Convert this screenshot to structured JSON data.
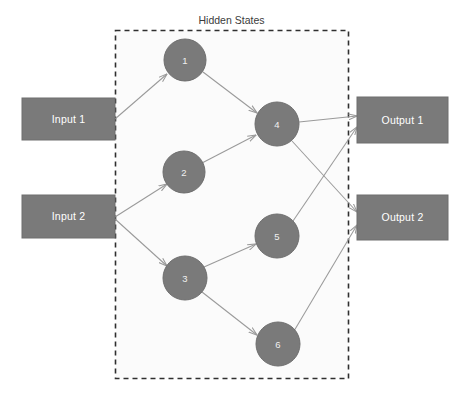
{
  "diagram": {
    "title": "Hidden States",
    "colors": {
      "node_fill": "#7a7a7a",
      "node_stroke": "#6e6e6e",
      "edge": "#9a9a9a",
      "group_border": "#2f2f2f",
      "group_fill": "#fbfbfb",
      "label_text": "#ffffff",
      "title_text": "#3b3b3b",
      "background": "#ffffff"
    },
    "group": {
      "label": "Hidden States",
      "x": 115,
      "y": 30,
      "width": 233,
      "height": 348
    },
    "inputs": [
      {
        "id": "input-1",
        "label": "Input 1",
        "x": 22,
        "y": 98,
        "width": 93,
        "height": 42
      },
      {
        "id": "input-2",
        "label": "Input 2",
        "x": 22,
        "y": 195,
        "width": 93,
        "height": 43
      }
    ],
    "outputs": [
      {
        "id": "output-1",
        "label": "Output 1",
        "x": 357,
        "y": 97,
        "width": 91,
        "height": 46
      },
      {
        "id": "output-2",
        "label": "Output 2",
        "x": 357,
        "y": 195,
        "width": 91,
        "height": 45
      }
    ],
    "hidden_states": [
      {
        "id": "node-1",
        "label": "1",
        "cx": 185,
        "cy": 60,
        "r": 21
      },
      {
        "id": "node-2",
        "label": "2",
        "cx": 184,
        "cy": 172,
        "r": 21
      },
      {
        "id": "node-3",
        "label": "3",
        "cx": 185,
        "cy": 278,
        "r": 22
      },
      {
        "id": "node-4",
        "label": "4",
        "cx": 277,
        "cy": 124,
        "r": 22
      },
      {
        "id": "node-5",
        "label": "5",
        "cx": 277,
        "cy": 236,
        "r": 22
      },
      {
        "id": "node-6",
        "label": "6",
        "cx": 278,
        "cy": 344,
        "r": 22
      }
    ],
    "edges": [
      {
        "id": "edge-input1-node1",
        "from": "input-1",
        "to": "node-1",
        "x1": 115,
        "y1": 119,
        "x2": 167,
        "y2": 74
      },
      {
        "id": "edge-input2-node2",
        "from": "input-2",
        "to": "node-2",
        "x1": 115,
        "y1": 217,
        "x2": 167,
        "y2": 184
      },
      {
        "id": "edge-input2-node3",
        "from": "input-2",
        "to": "node-3",
        "x1": 115,
        "y1": 219,
        "x2": 167,
        "y2": 266
      },
      {
        "id": "edge-node1-node4",
        "from": "node-1",
        "to": "node-4",
        "x1": 203,
        "y1": 72,
        "x2": 257,
        "y2": 113
      },
      {
        "id": "edge-node2-node4",
        "from": "node-2",
        "to": "node-4",
        "x1": 202,
        "y1": 163,
        "x2": 256,
        "y2": 135
      },
      {
        "id": "edge-node3-node5",
        "from": "node-3",
        "to": "node-5",
        "x1": 204,
        "y1": 267,
        "x2": 256,
        "y2": 244
      },
      {
        "id": "edge-node3-node6",
        "from": "node-3",
        "to": "node-6",
        "x1": 202,
        "y1": 292,
        "x2": 257,
        "y2": 335
      },
      {
        "id": "edge-node4-output1",
        "from": "node-4",
        "to": "output-1",
        "x1": 299,
        "y1": 122,
        "x2": 357,
        "y2": 116
      },
      {
        "id": "edge-node4-output2",
        "from": "node-4",
        "to": "output-2",
        "x1": 292,
        "y1": 141,
        "x2": 357,
        "y2": 212
      },
      {
        "id": "edge-node5-output1",
        "from": "node-5",
        "to": "output-1",
        "x1": 293,
        "y1": 221,
        "x2": 357,
        "y2": 127
      },
      {
        "id": "edge-node6-output2",
        "from": "node-6",
        "to": "output-2",
        "x1": 294,
        "y1": 331,
        "x2": 357,
        "y2": 225
      }
    ]
  }
}
